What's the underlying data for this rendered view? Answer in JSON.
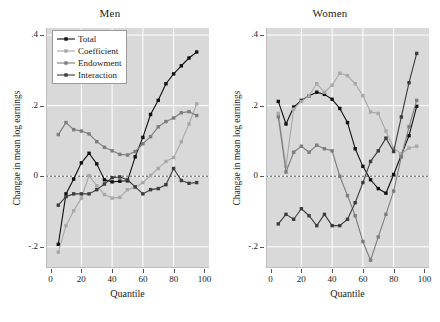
{
  "figure": {
    "width": 440,
    "height": 322,
    "background": "#ffffff",
    "panel_background": "#d9d9d9",
    "gridline_color": "#ffffff",
    "zeroline_color": "#555555"
  },
  "legend": {
    "position": "top-left-of-men-panel",
    "items": [
      {
        "label": "Total",
        "color": "#111111"
      },
      {
        "label": "Coefficient",
        "color": "#a8a8a8"
      },
      {
        "label": "Endowment",
        "color": "#7d7d7d"
      },
      {
        "label": "Interaction",
        "color": "#3c3c3c"
      }
    ]
  },
  "axes": {
    "xlabel": "Quantile",
    "ylabel": "Changae in mean log earnings",
    "xticks": [
      0,
      20,
      40,
      60,
      80,
      100
    ],
    "xticklabels": [
      "0",
      "20",
      "40",
      "60",
      "80",
      "100"
    ],
    "yticks": [
      -0.2,
      0,
      0.2,
      0.4
    ],
    "yticklabels": [
      "-.2",
      "0",
      ".2",
      ".4"
    ],
    "xlim": [
      -3,
      103
    ],
    "ylim": [
      -0.26,
      0.42
    ],
    "grid": "white gridlines at x=20,40,60,80 and y=-.2,0,.2,.4",
    "zero_reference_line": true
  },
  "chart_data": {
    "type": "line",
    "title": "",
    "xlabel": "Quantile",
    "ylabel": "Changae in mean log earnings",
    "xlim": [
      -3,
      103
    ],
    "ylim": [
      -0.26,
      0.42
    ],
    "grid": true,
    "legend_position": "upper left (Men panel)",
    "panels": [
      {
        "title": "Men",
        "x": [
          5,
          10,
          15,
          20,
          25,
          30,
          35,
          40,
          45,
          50,
          55,
          60,
          65,
          70,
          75,
          80,
          85,
          90,
          95
        ],
        "series": [
          {
            "name": "Total",
            "color": "#111111",
            "values": [
              -0.193,
              -0.05,
              -0.008,
              0.038,
              0.065,
              0.035,
              -0.01,
              -0.016,
              -0.014,
              -0.013,
              0.055,
              0.11,
              0.175,
              0.215,
              0.262,
              0.29,
              0.313,
              0.335,
              0.352
            ]
          },
          {
            "name": "Coefficient",
            "color": "#a8a8a8",
            "values": [
              -0.215,
              -0.14,
              -0.098,
              -0.062,
              0.002,
              -0.027,
              -0.052,
              -0.062,
              -0.06,
              -0.038,
              -0.032,
              -0.018,
              0.002,
              0.022,
              0.042,
              0.053,
              0.098,
              0.148,
              0.205
            ]
          },
          {
            "name": "Endowment",
            "color": "#7d7d7d",
            "values": [
              0.118,
              0.152,
              0.132,
              0.128,
              0.12,
              0.098,
              0.082,
              0.072,
              0.062,
              0.06,
              0.07,
              0.092,
              0.112,
              0.14,
              0.155,
              0.165,
              0.18,
              0.183,
              0.172
            ]
          },
          {
            "name": "Interaction",
            "color": "#3c3c3c",
            "values": [
              -0.082,
              -0.058,
              -0.05,
              -0.05,
              -0.05,
              -0.038,
              -0.022,
              -0.004,
              -0.002,
              -0.01,
              -0.03,
              -0.05,
              -0.038,
              -0.035,
              -0.024,
              0.022,
              -0.012,
              -0.02,
              -0.018
            ]
          }
        ]
      },
      {
        "title": "Women",
        "x": [
          5,
          10,
          15,
          20,
          25,
          30,
          35,
          40,
          45,
          50,
          55,
          60,
          65,
          70,
          75,
          80,
          85,
          90,
          95
        ],
        "series": [
          {
            "name": "Total",
            "color": "#111111",
            "values": [
              0.212,
              0.148,
              0.196,
              0.215,
              0.228,
              0.238,
              0.232,
              0.218,
              0.192,
              0.152,
              0.078,
              0.028,
              -0.01,
              -0.035,
              -0.048,
              0.005,
              0.06,
              0.115,
              0.198
            ]
          },
          {
            "name": "Coefficient",
            "color": "#a8a8a8",
            "values": [
              0.178,
              0.028,
              0.19,
              0.212,
              0.228,
              0.262,
              0.238,
              0.258,
              0.292,
              0.285,
              0.262,
              0.228,
              0.182,
              0.178,
              0.128,
              0.08,
              0.063,
              0.08,
              0.085
            ]
          },
          {
            "name": "Endowment",
            "color": "#7d7d7d",
            "values": [
              0.168,
              0.012,
              0.068,
              0.085,
              0.068,
              0.088,
              0.078,
              0.072,
              0.0,
              -0.055,
              -0.112,
              -0.185,
              -0.238,
              -0.172,
              -0.108,
              -0.042,
              0.055,
              0.14,
              0.215
            ]
          },
          {
            "name": "Interaction",
            "color": "#3c3c3c",
            "values": [
              -0.135,
              -0.108,
              -0.122,
              -0.092,
              -0.112,
              -0.14,
              -0.108,
              -0.14,
              -0.14,
              -0.122,
              -0.075,
              -0.018,
              0.042,
              0.072,
              0.108,
              0.07,
              0.168,
              0.265,
              0.348
            ]
          }
        ]
      }
    ]
  }
}
